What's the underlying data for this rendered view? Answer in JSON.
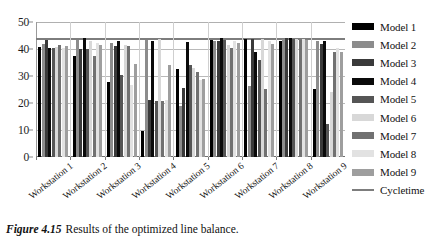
{
  "caption": {
    "figure_number": "Figure 4.15",
    "text": "Results of the optimized line balance."
  },
  "chart_data": {
    "type": "bar",
    "title": "",
    "xlabel": "",
    "ylabel": "",
    "ylim": [
      0,
      50
    ],
    "yticks": [
      0,
      10,
      20,
      30,
      40,
      50
    ],
    "grid": true,
    "legend_position": "right",
    "categories": [
      "Workstation 1",
      "Workstation 2",
      "Workstation 3",
      "Workstation 4",
      "Workstation 5",
      "Workstation 6",
      "Workstation 7",
      "Workstation 8",
      "Workstation 9"
    ],
    "series": [
      {
        "name": "Model 1",
        "color": "#000000",
        "values": [
          40.6,
          37.3,
          27.7,
          35.8,
          32.5,
          0,
          0,
          0,
          25.3
        ]
      },
      {
        "name": "Model 2",
        "color": "#8c8c8c",
        "values": [
          42.0,
          43.4,
          42.4,
          43.5,
          18.9,
          0,
          0,
          0,
          0
        ]
      },
      {
        "name": "Model 3",
        "color": "#3a3a3a",
        "values": [
          43.2,
          40.0,
          41.3,
          41.6,
          25.5,
          0,
          0,
          0,
          0
        ]
      },
      {
        "name": "Model 4",
        "color": "#0a0a0a",
        "values": [
          40.4,
          43.9,
          43.0,
          43.1,
          42.7,
          0,
          0,
          0,
          43.0
        ]
      },
      {
        "name": "Model 5",
        "color": "#555555",
        "values": [
          40.4,
          40.1,
          30.2,
          20.8,
          34.0,
          0,
          0,
          0,
          41.9
        ]
      },
      {
        "name": "Model 6",
        "color": "#d8d8d8",
        "values": [
          40.6,
          43.1,
          41.4,
          43.6,
          33.0,
          0,
          0,
          0,
          43.1
        ]
      },
      {
        "name": "Model 7",
        "color": "#717171",
        "values": [
          41.6,
          37.3,
          41.2,
          20.9,
          31.5,
          0,
          0,
          0,
          12.3
        ]
      },
      {
        "name": "Model 8",
        "color": "#e2e2e2",
        "values": [
          40.5,
          42.4,
          26.8,
          21.0,
          28.6,
          0,
          0,
          0,
          24.2
        ]
      },
      {
        "name": "Model 9",
        "color": "#9e9e9e",
        "values": [
          41.0,
          41.6,
          34.6,
          33.9,
          29.0,
          0,
          0,
          0,
          38.9
        ]
      }
    ],
    "reference_line": {
      "name": "Cycletime",
      "value": 44,
      "color": "#7d7d7d"
    },
    "bar_matrix": [
      [
        40.6,
        42.0,
        43.2,
        40.4,
        40.4,
        40.6,
        41.6,
        40.5,
        41.0
      ],
      [
        37.3,
        43.4,
        40.0,
        43.9,
        40.1,
        43.1,
        37.3,
        42.4,
        41.6
      ],
      [
        27.7,
        42.4,
        41.3,
        43.0,
        30.2,
        41.4,
        41.2,
        26.8,
        34.6
      ],
      [
        35.8,
        43.5,
        41.6,
        43.1,
        20.8,
        43.6,
        20.9,
        21.0,
        33.9
      ],
      [
        32.5,
        18.9,
        25.5,
        42.7,
        34.0,
        33.0,
        31.5,
        28.6,
        29.0
      ],
      [
        43.2,
        42.9,
        43.1,
        44.0,
        43.5,
        34.0,
        40.4,
        43.1,
        42.2
      ],
      [
        43.6,
        43.2,
        43.6,
        38.9,
        40.0,
        43.7,
        25.3,
        43.0,
        41.9
      ],
      [
        43.1,
        12.3,
        24.2,
        38.9,
        0,
        0,
        0,
        0,
        0
      ],
      [
        25.3,
        43.0,
        41.9,
        43.1,
        12.3,
        24.2,
        38.9,
        0,
        0
      ]
    ],
    "groups": [
      {
        "category": "Workstation 1",
        "values": [
          40.6,
          42.0,
          43.2,
          40.4,
          40.4,
          40.6,
          41.6,
          40.5,
          41.0
        ]
      },
      {
        "category": "Workstation 2",
        "values": [
          37.3,
          43.4,
          40.0,
          43.9,
          40.1,
          43.1,
          37.3,
          42.4,
          41.6
        ]
      },
      {
        "category": "Workstation 3",
        "values": [
          27.7,
          42.4,
          41.3,
          43.0,
          30.2,
          41.4,
          41.2,
          26.8,
          34.6
        ]
      },
      {
        "category": "Workstation 4",
        "values": [
          9.8,
          43.5,
          21.0,
          43.1,
          20.8,
          43.6,
          20.9,
          21.0,
          33.9
        ]
      },
      {
        "category": "Workstation 5",
        "values": [
          32.5,
          18.9,
          25.5,
          42.7,
          34.0,
          33.0,
          31.5,
          28.6,
          29.0
        ]
      },
      {
        "category": "Workstation 6",
        "values": [
          43.2,
          42.9,
          43.1,
          44.0,
          43.5,
          41.5,
          40.4,
          43.1,
          42.2
        ]
      },
      {
        "category": "Workstation 7",
        "values": [
          43.6,
          26.3,
          43.6,
          38.9,
          35.8,
          43.7,
          25.3,
          43.0,
          41.9
        ]
      },
      {
        "category": "Workstation 8",
        "values": [
          43.1,
          43.8,
          44.0,
          43.9,
          43.6,
          43.8,
          43.5,
          43.7,
          43.2
        ]
      },
      {
        "category": "Workstation 9",
        "values": [
          25.3,
          43.0,
          41.9,
          43.1,
          12.3,
          24.2,
          38.9,
          40.4,
          38.9
        ]
      }
    ]
  },
  "legend": {
    "entries": [
      {
        "label": "Model 1",
        "color": "#000000",
        "kind": "bar"
      },
      {
        "label": "Model 2",
        "color": "#8c8c8c",
        "kind": "bar"
      },
      {
        "label": "Model 3",
        "color": "#3a3a3a",
        "kind": "bar"
      },
      {
        "label": "Model 4",
        "color": "#0a0a0a",
        "kind": "bar"
      },
      {
        "label": "Model 5",
        "color": "#555555",
        "kind": "bar"
      },
      {
        "label": "Model 6",
        "color": "#d8d8d8",
        "kind": "bar"
      },
      {
        "label": "Model 7",
        "color": "#717171",
        "kind": "bar"
      },
      {
        "label": "Model 8",
        "color": "#e2e2e2",
        "kind": "bar"
      },
      {
        "label": "Model 9",
        "color": "#9e9e9e",
        "kind": "bar"
      },
      {
        "label": "Cycletime",
        "color": "#7d7d7d",
        "kind": "line"
      }
    ]
  }
}
